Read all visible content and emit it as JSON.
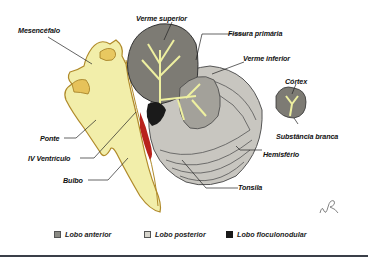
{
  "diagram": {
    "labels": {
      "mesencefalo": "Mesencéfalo",
      "verme_superior": "Verme superior",
      "fissura_primaria": "Fissura primária",
      "verme_inferior": "Verme inferior",
      "cortex": "Córtex",
      "substancia_branca": "Substância branca",
      "ponte": "Ponte",
      "iv_ventriculo": "IV Ventrículo",
      "bulbo": "Bulbo",
      "hemisferio": "Hemisfério",
      "tonsila": "Tonsila"
    },
    "legend": [
      {
        "label": "Lobo anterior",
        "color": "#8a8a84"
      },
      {
        "label": "Lobo posterior",
        "color": "#d6d4cc"
      },
      {
        "label": "Lobo floculonodular",
        "color": "#1a1a1a"
      }
    ],
    "colors": {
      "brainstem": "#f2eeaa",
      "brainstem_outline": "#b08a2a",
      "anterior_lobe": "#7d7b74",
      "posterior_lobe": "#bdbbb4",
      "white_matter": "#eef0a0",
      "ventricle": "#b8221c",
      "floculonodular": "#1a1a1a",
      "bottom_rule": "#3a3f48"
    }
  }
}
